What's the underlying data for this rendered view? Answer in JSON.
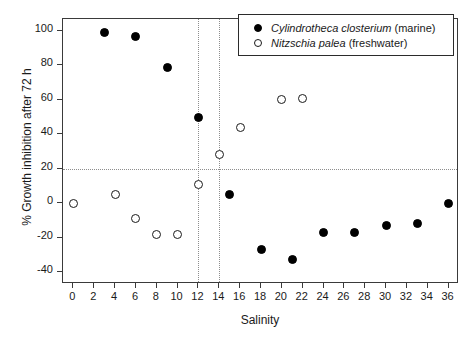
{
  "chart_data": {
    "type": "scatter",
    "title": "",
    "xlabel": "Salinity",
    "ylabel": "% Growth inhibition after 72 h",
    "xlim": [
      -1,
      37
    ],
    "ylim": [
      -47,
      107
    ],
    "xticks": [
      0,
      2,
      4,
      6,
      8,
      10,
      12,
      14,
      16,
      18,
      20,
      22,
      24,
      26,
      28,
      30,
      32,
      34,
      36
    ],
    "yticks": [
      -40,
      -20,
      0,
      20,
      40,
      60,
      80,
      100
    ],
    "grid": false,
    "legend_position": "top-right",
    "reference_lines": {
      "vertical": [
        12,
        14
      ],
      "horizontal": [
        20
      ]
    },
    "series": [
      {
        "name": "Cylindrotheca closterium",
        "name_italic": "Cylindrotheca closterium",
        "habitat": "(marine)",
        "marker": "filled-circle",
        "color": "#000000",
        "points": [
          {
            "x": 3,
            "y": 99
          },
          {
            "x": 6,
            "y": 97
          },
          {
            "x": 9,
            "y": 79
          },
          {
            "x": 12,
            "y": 50
          },
          {
            "x": 15,
            "y": 5
          },
          {
            "x": 18,
            "y": -27
          },
          {
            "x": 21,
            "y": -33
          },
          {
            "x": 24,
            "y": -17
          },
          {
            "x": 27,
            "y": -17
          },
          {
            "x": 30,
            "y": -13
          },
          {
            "x": 33,
            "y": -12
          },
          {
            "x": 36,
            "y": 0
          }
        ]
      },
      {
        "name": "Nitzschia palea",
        "name_italic": "Nitzschia palea",
        "habitat": "(freshwater)",
        "marker": "open-circle",
        "color": "#ffffff",
        "points": [
          {
            "x": 0,
            "y": 0
          },
          {
            "x": 4,
            "y": 5
          },
          {
            "x": 6,
            "y": -9
          },
          {
            "x": 8,
            "y": -18
          },
          {
            "x": 10,
            "y": -18
          },
          {
            "x": 12,
            "y": 11
          },
          {
            "x": 14,
            "y": 28
          },
          {
            "x": 16,
            "y": 44
          },
          {
            "x": 20,
            "y": 60
          },
          {
            "x": 22,
            "y": 61
          }
        ]
      }
    ]
  },
  "legend": {
    "entries": [
      {
        "species": "Cylindrotheca closterium",
        "habitat": "(marine)"
      },
      {
        "species": "Nitzschia palea",
        "habitat": "(freshwater)"
      }
    ]
  }
}
